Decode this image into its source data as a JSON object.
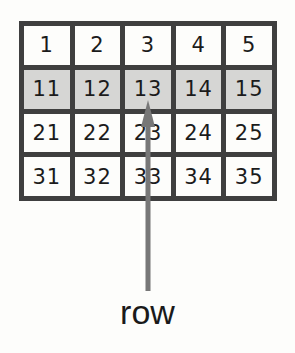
{
  "grid": {
    "rows": [
      {
        "highlighted": false,
        "cells": [
          "1",
          "2",
          "3",
          "4",
          "5"
        ]
      },
      {
        "highlighted": true,
        "cells": [
          "11",
          "12",
          "13",
          "14",
          "15"
        ]
      },
      {
        "highlighted": false,
        "cells": [
          "21",
          "22",
          "23",
          "24",
          "25"
        ]
      },
      {
        "highlighted": false,
        "cells": [
          "31",
          "32",
          "33",
          "34",
          "35"
        ]
      }
    ],
    "highlight_color": "#d6d6d4",
    "border_color": "#3f3f3f"
  },
  "arrow": {
    "color": "#777777",
    "points_to_cell": "13",
    "icon": "arrow-up-icon"
  },
  "label": {
    "text": "row"
  }
}
